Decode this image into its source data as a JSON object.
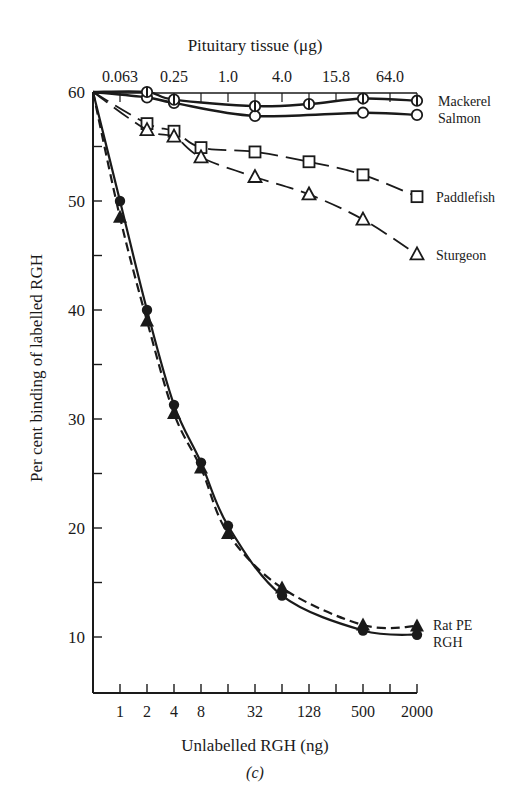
{
  "chart_data": {
    "type": "line",
    "panel_label": "(c)",
    "title": "",
    "top_xlabel": "Pituitary tissue (μg)",
    "top_xticks": [
      "0.063",
      "0.25",
      "1.0",
      "4.0",
      "15.8",
      "64.0"
    ],
    "xlabel": "Unlabelled RGH (ng)",
    "xticks": [
      "1",
      "2",
      "4",
      "8",
      "32",
      "128",
      "500",
      "2000"
    ],
    "ylabel": "Per cent binding of labelled RGH",
    "yticks": [
      "10",
      "20",
      "30",
      "40",
      "50",
      "60"
    ],
    "ylim": [
      5,
      60
    ],
    "x_scale": "log2 (tick index 0 = axis origin, 1 = 1 ng / 0.063 μg)",
    "grid": false,
    "legend_position": "right, inline labels",
    "series": [
      {
        "name": "Mackerel",
        "marker": "half-filled circle",
        "line": "solid",
        "x_index": [
          0,
          2,
          3,
          6,
          8,
          10,
          12
        ],
        "values": [
          60,
          60.0,
          59.3,
          58.7,
          58.9,
          59.4,
          59.2
        ]
      },
      {
        "name": "Salmon",
        "marker": "open circle",
        "line": "solid",
        "x_index": [
          0,
          2,
          3,
          6,
          10,
          12
        ],
        "values": [
          60,
          59.5,
          59.0,
          57.8,
          58.1,
          57.9
        ]
      },
      {
        "name": "Paddlefish",
        "marker": "open square",
        "line": "dashed",
        "x_index": [
          0,
          2,
          3,
          4,
          6,
          8,
          10,
          12
        ],
        "values": [
          60,
          57.1,
          56.4,
          54.9,
          54.5,
          53.6,
          52.4,
          50.4
        ]
      },
      {
        "name": "Sturgeon",
        "marker": "open triangle",
        "line": "dashed",
        "x_index": [
          0,
          2,
          3,
          4,
          6,
          8,
          10,
          12
        ],
        "values": [
          60,
          56.5,
          55.9,
          54.0,
          52.2,
          50.6,
          48.3,
          45.1
        ]
      },
      {
        "name": "Rat PE",
        "marker": "filled triangle",
        "line": "dashed",
        "x_index": [
          0,
          1,
          2,
          3,
          4,
          5,
          7,
          10,
          12
        ],
        "values": [
          60,
          48.5,
          39.0,
          30.5,
          25.5,
          19.5,
          14.5,
          11.1,
          11.0
        ]
      },
      {
        "name": "RGH",
        "marker": "filled circle",
        "line": "solid",
        "x_index": [
          0,
          1,
          2,
          3,
          4,
          5,
          7,
          10,
          12
        ],
        "values": [
          60,
          50.0,
          40.0,
          31.3,
          26.0,
          20.2,
          13.8,
          10.6,
          10.2
        ]
      }
    ]
  },
  "labels": {
    "top_axis_title": "Pituitary tissue (μg)",
    "bottom_axis_title": "Unlabelled RGH (ng)",
    "y_axis_title": "Per cent binding of labelled RGH",
    "panel": "(c)",
    "legend": {
      "mackerel": "Mackerel",
      "salmon": "Salmon",
      "paddlefish": "Paddlefish",
      "sturgeon": "Sturgeon",
      "ratpe": "Rat PE",
      "rgh": "RGH"
    }
  }
}
